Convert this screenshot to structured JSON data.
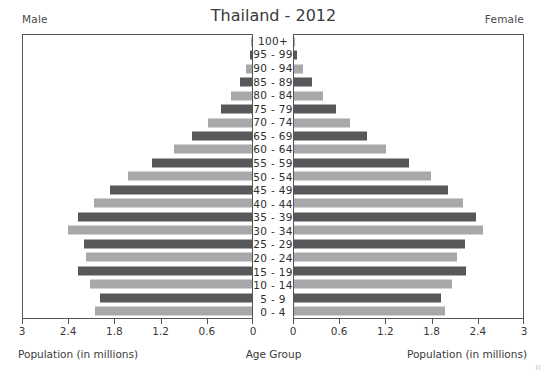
{
  "header": {
    "title": "Thailand - 2012",
    "left_label": "Male",
    "right_label": "Female"
  },
  "axes": {
    "left_title": "Population (in millions)",
    "right_title": "Population (in millions)",
    "center_title": "Age Group",
    "left_ticks": [
      "3",
      "2.4",
      "1.8",
      "1.2",
      "0.6",
      "0"
    ],
    "right_ticks": [
      "0",
      "0.6",
      "1.2",
      "1.8",
      "2.4",
      "3"
    ]
  },
  "corner_mark": "II",
  "colors": {
    "bar_dark": "#58585a",
    "bar_light": "#a8a8aa",
    "frame": "#555555",
    "text": "#3a3a3a",
    "background": "#ffffff"
  },
  "chart_data": {
    "type": "bar",
    "subtype": "population-pyramid",
    "title": "Thailand - 2012",
    "xlabel": "Population (in millions)",
    "ylabel": "Age Group",
    "xlim": [
      0,
      3
    ],
    "xticks": [
      0,
      0.6,
      1.2,
      1.8,
      2.4,
      3
    ],
    "grid": false,
    "legend": [
      "Male",
      "Female"
    ],
    "legend_position": "top-corners",
    "categories": [
      "100+",
      "95 - 99",
      "90 - 94",
      "85 - 89",
      "80 - 84",
      "75 - 79",
      "70 - 74",
      "65 - 69",
      "60 - 64",
      "55 - 59",
      "50 - 54",
      "45 - 49",
      "40 - 44",
      "35 - 39",
      "30 - 34",
      "25 - 29",
      "20 - 24",
      "15 - 19",
      "10 - 14",
      "5 - 9",
      "0 - 4"
    ],
    "series": [
      {
        "name": "Male",
        "side": "left",
        "values": [
          0.01,
          0.03,
          0.08,
          0.16,
          0.27,
          0.41,
          0.58,
          0.78,
          1.02,
          1.31,
          1.62,
          1.86,
          2.07,
          2.28,
          2.41,
          2.2,
          2.18,
          2.28,
          2.12,
          1.99,
          2.06
        ]
      },
      {
        "name": "Female",
        "side": "right",
        "values": [
          0.01,
          0.04,
          0.12,
          0.24,
          0.38,
          0.55,
          0.74,
          0.95,
          1.21,
          1.5,
          1.8,
          2.02,
          2.21,
          2.38,
          2.47,
          2.24,
          2.13,
          2.25,
          2.07,
          1.93,
          1.98
        ]
      }
    ]
  }
}
